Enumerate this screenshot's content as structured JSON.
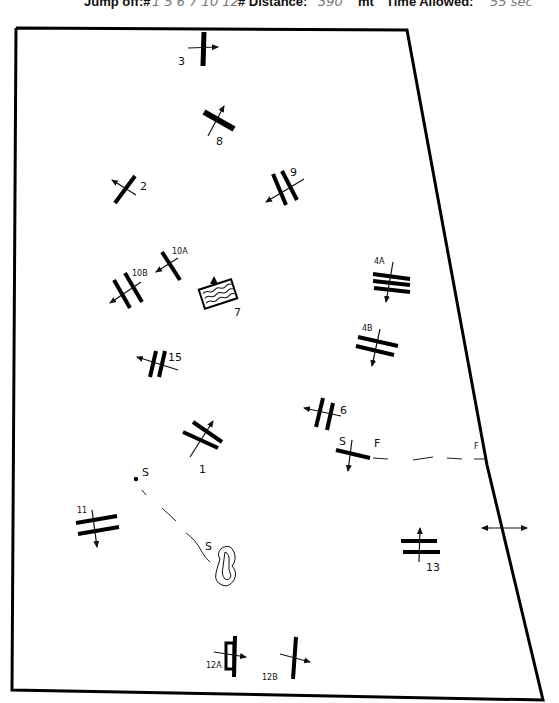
{
  "header": {
    "jump_off_label": "Jump off:#",
    "jump_off_value": "1 5 6 7 10 12",
    "distance_label": "# Distance:",
    "distance_value": "390",
    "distance_unit": "mt",
    "time_label": "Time Allowed:",
    "time_value": "55 sec"
  },
  "arena": {
    "border_color": "#000000",
    "corners": [
      [
        16,
        28
      ],
      [
        407,
        30
      ],
      [
        487,
        465
      ],
      [
        543,
        700
      ],
      [
        12,
        690
      ]
    ]
  },
  "fences": [
    {
      "label": "3",
      "type": "vertical"
    },
    {
      "label": "8",
      "type": "vertical"
    },
    {
      "label": "2",
      "type": "vertical"
    },
    {
      "label": "9",
      "type": "oxer"
    },
    {
      "label": "10A",
      "type": "vertical"
    },
    {
      "label": "10B",
      "type": "oxer"
    },
    {
      "label": "7",
      "type": "water"
    },
    {
      "label": "15",
      "type": "oxer"
    },
    {
      "label": "4A",
      "type": "triple-bar"
    },
    {
      "label": "4B",
      "type": "oxer"
    },
    {
      "label": "6",
      "type": "oxer"
    },
    {
      "label": "1",
      "type": "oxer"
    },
    {
      "label": "11",
      "type": "oxer"
    },
    {
      "label": "13",
      "type": "oxer"
    },
    {
      "label": "12A",
      "type": "vertical"
    },
    {
      "label": "12B",
      "type": "vertical"
    }
  ],
  "markers": {
    "start_main": "S",
    "finish_left": "F",
    "finish_right": "F",
    "start_jumpoff": "S",
    "start_jumpoff_dot": "S"
  }
}
